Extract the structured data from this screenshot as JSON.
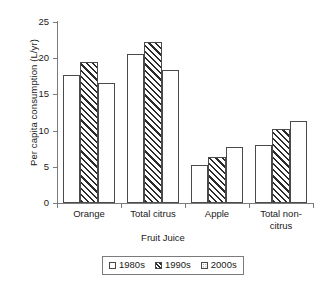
{
  "chart_data": {
    "type": "bar",
    "title": "",
    "xlabel": "Fruit Juice",
    "ylabel": "Per capita consumption (L/yr)",
    "categories": [
      "Orange",
      "Total citrus",
      "Apple",
      "Total non-citrus"
    ],
    "category_lines": [
      [
        "Orange"
      ],
      [
        "Total citrus"
      ],
      [
        "Apple"
      ],
      [
        "Total non-",
        "citrus"
      ]
    ],
    "series": [
      {
        "name": "1980s",
        "pattern": "solid",
        "values": [
          17.7,
          20.6,
          5.3,
          8.0
        ]
      },
      {
        "name": "1990s",
        "pattern": "hatch",
        "values": [
          19.5,
          22.2,
          6.3,
          10.2
        ]
      },
      {
        "name": "2000s",
        "pattern": "dots",
        "values": [
          16.6,
          18.4,
          7.7,
          11.3
        ]
      }
    ],
    "ylim": [
      0,
      25
    ],
    "yticks": [
      0,
      5,
      10,
      15,
      20,
      25
    ],
    "ytick_labels": [
      "0",
      "5",
      "10",
      "15",
      "20",
      "25"
    ],
    "grid": false,
    "legend_position": "bottom",
    "colors": {
      "axis": "#7b7b7b",
      "bar_edge": "#4a4a4a",
      "bar_fill": "#ffffff",
      "hatch": "#2b2b2b",
      "dots": "#6e6e6e",
      "text": "#1a1a1a"
    }
  }
}
